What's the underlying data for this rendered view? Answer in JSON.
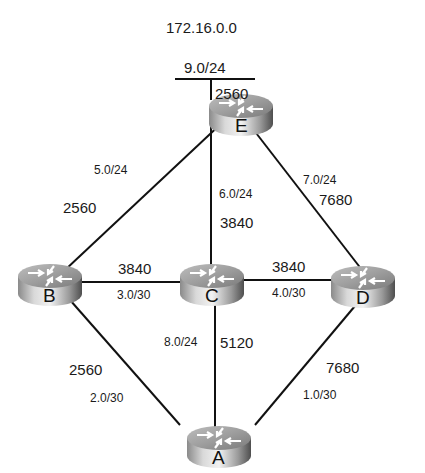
{
  "diagram": {
    "title": "172.16.0.0",
    "stub_network": {
      "label": "9.0/24",
      "cost": "2560"
    },
    "routers": [
      {
        "id": "E",
        "label": "E"
      },
      {
        "id": "B",
        "label": "B"
      },
      {
        "id": "C",
        "label": "C"
      },
      {
        "id": "D",
        "label": "D"
      },
      {
        "id": "A",
        "label": "A"
      }
    ],
    "links": [
      {
        "from": "E",
        "to": "B",
        "subnet": "5.0/24",
        "cost": "2560"
      },
      {
        "from": "E",
        "to": "C",
        "subnet": "6.0/24",
        "cost": "3840"
      },
      {
        "from": "E",
        "to": "D",
        "subnet": "7.0/24",
        "cost": "7680"
      },
      {
        "from": "B",
        "to": "C",
        "subnet": "3.0/30",
        "cost": "3840"
      },
      {
        "from": "C",
        "to": "D",
        "subnet": "4.0/30",
        "cost": "3840"
      },
      {
        "from": "C",
        "to": "A",
        "subnet": "8.0/24",
        "cost": "5120"
      },
      {
        "from": "B",
        "to": "A",
        "subnet": "2.0/30",
        "cost": "2560"
      },
      {
        "from": "D",
        "to": "A",
        "subnet": "1.0/30",
        "cost": "7680"
      }
    ],
    "colors": {
      "line": "#111111",
      "router_light": "#e6e6e6",
      "router_dark": "#6e6e6e"
    }
  }
}
